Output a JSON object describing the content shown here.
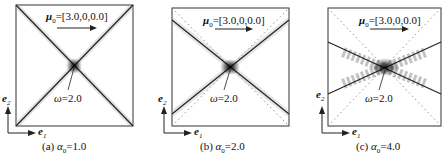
{
  "figure": {
    "panels": [
      {
        "id": "a",
        "caption_letter": "(a)",
        "alpha_label": "α",
        "alpha_sub": "0",
        "alpha_value": "=1.0",
        "mu_label": "μ",
        "mu_sub": "0",
        "mu_value": "=[3.0,0,0.0]",
        "omega_label": "ω",
        "omega_value": "=2.0"
      },
      {
        "id": "b",
        "caption_letter": "(b)",
        "alpha_label": "α",
        "alpha_sub": "0",
        "alpha_value": "=2.0",
        "mu_label": "μ",
        "mu_sub": "0",
        "mu_value": "=[3.0,0,0.0]",
        "omega_label": "ω",
        "omega_value": "=2.0"
      },
      {
        "id": "c",
        "caption_letter": "(c)",
        "alpha_label": "α",
        "alpha_sub": "0",
        "alpha_value": "=4.0",
        "mu_label": "μ",
        "mu_sub": "0",
        "mu_value": "=[3.0,0,0.0]",
        "omega_label": "ω",
        "omega_value": "=2.0"
      }
    ],
    "axes": {
      "x_label": "e",
      "x_sub": "1",
      "y_label": "e",
      "y_sub": "2"
    }
  }
}
